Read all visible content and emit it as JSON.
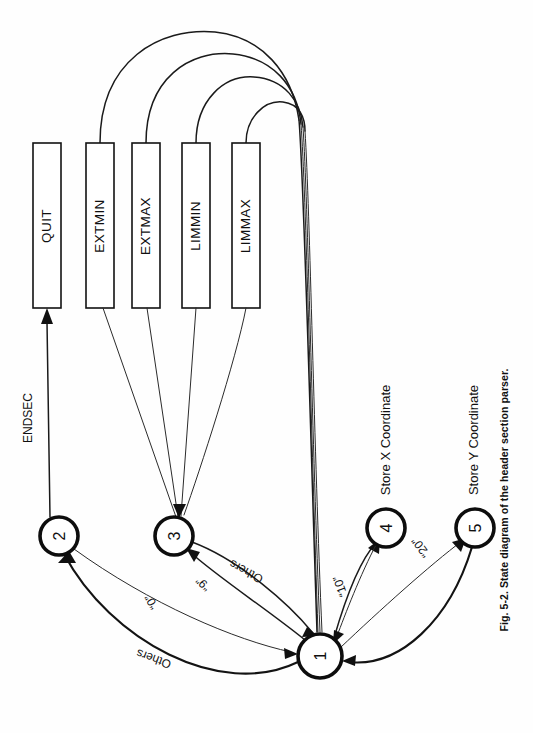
{
  "figure": {
    "caption": "Fig. 5-2. State diagram of the header section parser.",
    "orientation": "rotated-90-ccw",
    "page_background": "#ffffff",
    "ink_color": "#101010"
  },
  "diagram": {
    "type": "state-diagram",
    "title": "State diagram of the header section parser",
    "states": [
      {
        "id": "1",
        "label": "1",
        "cx": 320,
        "cy": 656,
        "r": 22,
        "role": "start-hub"
      },
      {
        "id": "2",
        "label": "2",
        "cx": 59,
        "cy": 536,
        "r": 19,
        "role": "normal"
      },
      {
        "id": "3",
        "label": "3",
        "cx": 174,
        "cy": 536,
        "r": 19,
        "role": "normal"
      },
      {
        "id": "4",
        "label": "4",
        "cx": 386,
        "cy": 528,
        "r": 19,
        "role": "normal"
      },
      {
        "id": "5",
        "label": "5",
        "cx": 475,
        "cy": 528,
        "r": 19,
        "role": "normal"
      }
    ],
    "boxes": [
      {
        "id": "quit",
        "label": "QUIT",
        "x": 33,
        "y": 143,
        "w": 28,
        "h": 165
      },
      {
        "id": "extmin",
        "label": "EXTMIN",
        "x": 86,
        "y": 143,
        "w": 28,
        "h": 165
      },
      {
        "id": "extmax",
        "label": "EXTMAX",
        "x": 132,
        "y": 143,
        "w": 28,
        "h": 165
      },
      {
        "id": "limmin",
        "label": "LIMMIN",
        "x": 182,
        "y": 143,
        "w": 28,
        "h": 165
      },
      {
        "id": "limmax",
        "label": "LIMMAX",
        "x": 232,
        "y": 143,
        "w": 28,
        "h": 165
      }
    ],
    "transitions": [
      {
        "id": "t-2-quit",
        "from": "2",
        "to": "quit",
        "label": "ENDSEC"
      },
      {
        "id": "t-1-2",
        "from": "1",
        "to": "2",
        "label": "Others"
      },
      {
        "id": "t-2-1",
        "from": "2",
        "to": "1",
        "label": "“0”"
      },
      {
        "id": "t-1-3",
        "from": "1",
        "to": "3",
        "label": "“9”"
      },
      {
        "id": "t-3-1",
        "from": "3",
        "to": "1",
        "label": "Others"
      },
      {
        "id": "t-1-4",
        "from": "1",
        "to": "4",
        "label": "“10”"
      },
      {
        "id": "t-4-1",
        "from": "4",
        "to": "1",
        "label": ""
      },
      {
        "id": "t-1-5",
        "from": "1",
        "to": "5",
        "label": "“20”"
      },
      {
        "id": "t-5-1",
        "from": "5",
        "to": "1",
        "label": ""
      },
      {
        "id": "t-extmin-1",
        "from": "extmin",
        "to": "1",
        "label": ""
      },
      {
        "id": "t-extmax-1",
        "from": "extmax",
        "to": "1",
        "label": ""
      },
      {
        "id": "t-limmin-1",
        "from": "limmin",
        "to": "1",
        "label": ""
      },
      {
        "id": "t-limmax-1",
        "from": "limmax",
        "to": "1",
        "label": ""
      },
      {
        "id": "t-3-extmin",
        "from": "3",
        "to": "extmin",
        "label": ""
      },
      {
        "id": "t-3-extmax",
        "from": "3",
        "to": "extmax",
        "label": ""
      },
      {
        "id": "t-3-limmin",
        "from": "3",
        "to": "limmin",
        "label": ""
      },
      {
        "id": "t-3-limmax",
        "from": "3",
        "to": "limmax",
        "label": ""
      }
    ],
    "actions": [
      {
        "id": "store-x",
        "label": "Store X Coordinate",
        "state": "4"
      },
      {
        "id": "store-y",
        "label": "Store Y Coordinate",
        "state": "5"
      }
    ],
    "edge_labels": [
      {
        "id": "lbl-endsec",
        "text": "ENDSEC"
      },
      {
        "id": "lbl-others-1",
        "text": "Others"
      },
      {
        "id": "lbl-zero",
        "text": "“0”"
      },
      {
        "id": "lbl-nine",
        "text": "“9”"
      },
      {
        "id": "lbl-others-2",
        "text": "Others"
      },
      {
        "id": "lbl-ten",
        "text": "“10”"
      },
      {
        "id": "lbl-twenty",
        "text": "“20”"
      }
    ]
  }
}
